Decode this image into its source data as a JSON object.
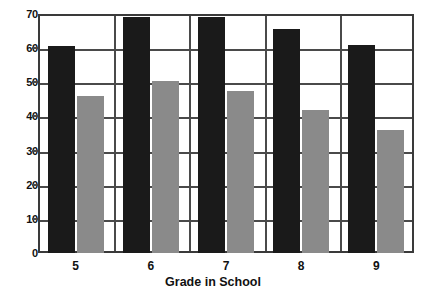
{
  "chart_data": {
    "type": "bar",
    "title": "",
    "xlabel": "Grade in School",
    "ylabel": "",
    "categories": [
      "5",
      "6",
      "7",
      "8",
      "9"
    ],
    "series": [
      {
        "name": "dark-series",
        "color": "#1a1a1a",
        "values": [
          60.5,
          69,
          69,
          65.5,
          61
        ]
      },
      {
        "name": "light-series",
        "color": "#8a8a8a",
        "values": [
          46,
          50.5,
          47.5,
          42,
          36
        ]
      }
    ],
    "ylim": [
      0,
      70
    ],
    "ytick_values": [
      0,
      10,
      20,
      30,
      40,
      50,
      60,
      70
    ],
    "ytick_labels": [
      "0",
      "10",
      "20",
      "30",
      "40",
      "50",
      "60",
      "70"
    ],
    "grid": "horizontal-and-vertical-category-separators",
    "legend": "none",
    "axis_color": "#4a4a4a",
    "background": "#ffffff"
  }
}
